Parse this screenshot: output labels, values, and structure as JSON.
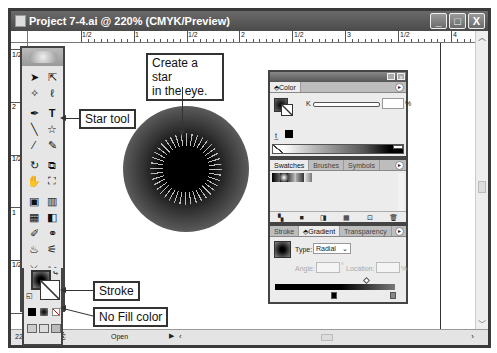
{
  "window": {
    "title": "Project 7-4.ai @ 220% (CMYK/Preview)",
    "buttons": {
      "minimize": "_",
      "maximize": "□",
      "close": "X"
    }
  },
  "ruler": {
    "horizontal_labels": [
      "1/2",
      "1",
      "1/2",
      "2",
      "1/2",
      "3",
      "1/2",
      "4"
    ],
    "vertical_labels": [
      "1/2",
      "2",
      "1/2",
      "1",
      "1/2"
    ]
  },
  "callouts": {
    "star_tool": "Star tool",
    "create_star": "Create a star in the eye.",
    "create_star_line1": "Create a star",
    "create_star_line2": "in the eye.",
    "stroke": "Stroke",
    "no_fill": "No Fill color"
  },
  "color_panel": {
    "tab": "Color",
    "slider_label": "K",
    "value": "",
    "unit": "%"
  },
  "swatches_panel": {
    "tabs": [
      "Swatches",
      "Brushes",
      "Symbols"
    ],
    "active_tab": "Swatches"
  },
  "gradient_panel": {
    "tabs": [
      "Stroke",
      "Gradient",
      "Transparency"
    ],
    "active_tab": "Gradient",
    "type_label": "Type:",
    "type_value": "Radial",
    "angle_label": "Angle:",
    "angle_value": "",
    "angle_unit": "°",
    "location_label": "Location:",
    "location_value": "",
    "location_unit": "%"
  },
  "status_bar": {
    "zoom": "220%",
    "status": "Open"
  }
}
